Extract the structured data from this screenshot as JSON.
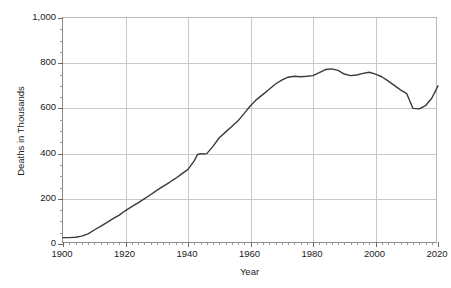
{
  "chart_data": {
    "type": "line",
    "title": "",
    "xlabel": "Year",
    "ylabel": "Deaths in Thousands",
    "xlim": [
      1900,
      2020
    ],
    "ylim": [
      0,
      1000
    ],
    "grid": true,
    "legend": false,
    "line_color": "#3a3a3a",
    "grid_color": "#c9c9c9",
    "axis_color": "#8c8c8c",
    "x_ticks": [
      1900,
      1920,
      1940,
      1960,
      1980,
      2000,
      2020
    ],
    "x_tick_labels": [
      "1900",
      "1920",
      "1940",
      "1960",
      "1980",
      "2000",
      "2020"
    ],
    "x_minor_step": 2,
    "y_ticks": [
      0,
      200,
      400,
      600,
      800,
      1000
    ],
    "y_tick_labels": [
      "0",
      "200",
      "400",
      "600",
      "800",
      "1,000"
    ],
    "y_minor_step": 50,
    "series": [
      {
        "name": "Deaths",
        "x": [
          1900,
          1902,
          1904,
          1906,
          1908,
          1910,
          1912,
          1914,
          1916,
          1918,
          1920,
          1922,
          1924,
          1926,
          1928,
          1930,
          1932,
          1934,
          1936,
          1938,
          1940,
          1942,
          1943,
          1944,
          1945,
          1946,
          1948,
          1950,
          1952,
          1954,
          1956,
          1958,
          1960,
          1962,
          1964,
          1966,
          1968,
          1970,
          1972,
          1974,
          1976,
          1978,
          1980,
          1982,
          1984,
          1986,
          1988,
          1990,
          1992,
          1994,
          1996,
          1998,
          2000,
          2002,
          2004,
          2006,
          2008,
          2010,
          2012,
          2014,
          2016,
          2018,
          2019,
          2020
        ],
        "values": [
          28,
          28,
          30,
          35,
          45,
          62,
          78,
          95,
          112,
          128,
          148,
          165,
          182,
          200,
          218,
          237,
          255,
          272,
          290,
          310,
          330,
          368,
          395,
          400,
          398,
          400,
          432,
          470,
          495,
          520,
          545,
          578,
          612,
          640,
          662,
          685,
          708,
          725,
          738,
          742,
          740,
          742,
          745,
          758,
          772,
          775,
          768,
          752,
          745,
          748,
          755,
          760,
          752,
          740,
          722,
          702,
          682,
          665,
          600,
          598,
          612,
          645,
          672,
          700
        ]
      }
    ]
  },
  "axes": {
    "y_title": "Deaths in Thousands",
    "x_title": "Year"
  }
}
